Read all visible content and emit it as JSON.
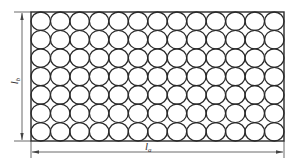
{
  "diagram": {
    "type": "circle-packing-layout",
    "grid": {
      "columns": 13,
      "rows": 7
    },
    "colors": {
      "stroke": "#2a2a2a",
      "dimension": "#444444",
      "background": "#ffffff"
    },
    "labels": {
      "width": {
        "base": "l",
        "sub": "a"
      },
      "height": {
        "base": "l",
        "sub": "b"
      }
    }
  }
}
